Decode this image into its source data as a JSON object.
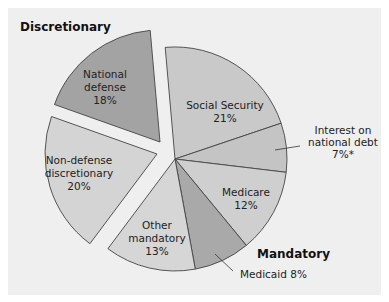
{
  "chart_data": {
    "type": "pie",
    "title": "",
    "exploded_groups": [
      "Discretionary"
    ],
    "groups": [
      {
        "name": "Discretionary",
        "slices": [
          "National defense",
          "Non-defense discretionary"
        ]
      },
      {
        "name": "Mandatory",
        "slices": [
          "Social Security",
          "Interest on national debt",
          "Medicare",
          "Medicaid",
          "Other mandatory"
        ]
      }
    ],
    "categories": [
      "Social Security",
      "Interest on national debt",
      "Medicare",
      "Medicaid",
      "Other mandatory",
      "Non-defense discretionary",
      "National defense"
    ],
    "values": [
      21,
      7,
      12,
      8,
      13,
      20,
      18
    ],
    "unit": "%",
    "footnote_marker": "Interest on national debt 7%*"
  },
  "colors": {
    "background": "#efefef",
    "social_security": "#c9c9c9",
    "interest": "#c4c4c4",
    "medicare": "#cfcfcf",
    "medicaid": "#a9a9a9",
    "other_mandatory": "#d6d6d6",
    "non_defense": "#d4d4d4",
    "national_defense": "#a3a3a3",
    "stroke": "#444444"
  },
  "labels": {
    "discretionary_title": "Discretionary",
    "mandatory_title": "Mandatory",
    "national_defense": [
      "National",
      "defense",
      "18%"
    ],
    "non_defense": [
      "Non-defense",
      "discretionary",
      "20%"
    ],
    "social_security": [
      "Social Security",
      "21%"
    ],
    "interest": [
      "Interest on",
      "national debt",
      "7%*"
    ],
    "medicare": [
      "Medicare",
      "12%"
    ],
    "medicaid": "Medicaid 8%",
    "other_mandatory": [
      "Other",
      "mandatory",
      "13%"
    ]
  }
}
